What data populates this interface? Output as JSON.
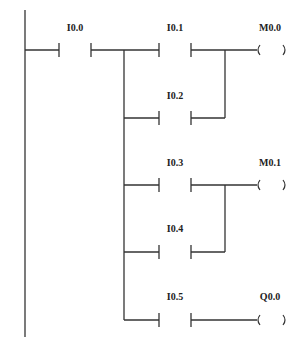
{
  "diagram": {
    "type": "ladder-logic",
    "line_color": "#333333",
    "rungs": [
      {
        "contact": "I0.0",
        "output": null
      },
      {
        "contact": "I0.1",
        "output": "M0.0"
      },
      {
        "contact": "I0.2",
        "output": null,
        "parallel_with": "I0.1"
      },
      {
        "contact": "I0.3",
        "output": "M0.1"
      },
      {
        "contact": "I0.4",
        "output": null,
        "parallel_with": "I0.3"
      },
      {
        "contact": "I0.5",
        "output": "Q0.0"
      }
    ],
    "labels": {
      "i00": "I0.0",
      "i01": "I0.1",
      "i02": "I0.2",
      "i03": "I0.3",
      "i04": "I0.4",
      "i05": "I0.5",
      "m00": "M0.0",
      "m01": "M0.1",
      "q00": "Q0.0"
    },
    "coil_glyph": {
      "open": "(",
      "close": ")"
    }
  }
}
